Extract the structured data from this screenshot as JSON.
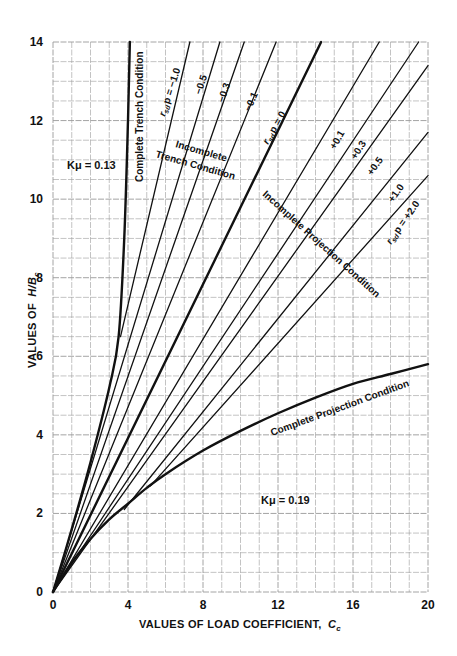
{
  "chart_data": {
    "type": "line",
    "title": "",
    "xlabel": "VALUES OF LOAD COEFFICIENT, Cc",
    "ylabel": "VALUES OF H/Bc",
    "xlim": [
      0,
      20
    ],
    "ylim": [
      0,
      14
    ],
    "x_ticks": [
      "0",
      "4",
      "8",
      "12",
      "16",
      "20"
    ],
    "y_ticks": [
      "0",
      "2",
      "4",
      "6",
      "8",
      "10",
      "12",
      "14"
    ],
    "grid": true,
    "legend": "none (inline labels)",
    "series": [
      {
        "name": "Complete Trench Condition",
        "weight": "heavy",
        "points": [
          [
            0,
            0
          ],
          [
            1,
            1.6
          ],
          [
            2,
            3.3
          ],
          [
            3,
            5.2
          ],
          [
            3.5,
            6.5
          ],
          [
            3.8,
            9
          ],
          [
            4.0,
            12
          ],
          [
            4.1,
            14
          ]
        ]
      },
      {
        "name": "r_sd p = -1.0",
        "weight": "light",
        "points": [
          [
            3.6,
            6.5
          ],
          [
            7.3,
            14
          ]
        ]
      },
      {
        "name": "r_sd p = -0.5",
        "weight": "light",
        "points": [
          [
            0,
            0
          ],
          [
            8.9,
            14
          ]
        ]
      },
      {
        "name": "r_sd p = -0.3",
        "weight": "light",
        "points": [
          [
            0,
            0
          ],
          [
            10.2,
            14
          ]
        ]
      },
      {
        "name": "r_sd p = -0.1",
        "weight": "light",
        "points": [
          [
            0,
            0
          ],
          [
            11.9,
            14
          ]
        ]
      },
      {
        "name": "r_sd p = 0",
        "weight": "heavy",
        "points": [
          [
            0,
            0
          ],
          [
            14.3,
            14
          ]
        ]
      },
      {
        "name": "r_sd p = +0.1",
        "weight": "light",
        "points": [
          [
            0,
            0
          ],
          [
            17.4,
            14
          ]
        ]
      },
      {
        "name": "r_sd p = +0.3",
        "weight": "light",
        "points": [
          [
            0,
            0
          ],
          [
            19.5,
            14
          ]
        ]
      },
      {
        "name": "r_sd p = +0.5",
        "weight": "light",
        "points": [
          [
            0,
            0
          ],
          [
            20,
            13.4
          ]
        ]
      },
      {
        "name": "r_sd p = +1.0",
        "weight": "light",
        "points": [
          [
            3.8,
            2.1
          ],
          [
            20,
            11.7
          ]
        ]
      },
      {
        "name": "r_sd p = +2.0",
        "weight": "light",
        "points": [
          [
            5.2,
            2.7
          ],
          [
            20,
            10.6
          ]
        ]
      },
      {
        "name": "Complete Projection Condition",
        "weight": "heavy",
        "points": [
          [
            0,
            0
          ],
          [
            1,
            0.75
          ],
          [
            2,
            1.35
          ],
          [
            3,
            1.85
          ],
          [
            4,
            2.25
          ],
          [
            5,
            2.65
          ],
          [
            6,
            3.0
          ],
          [
            8,
            3.6
          ],
          [
            10,
            4.1
          ],
          [
            12,
            4.55
          ],
          [
            14,
            4.95
          ],
          [
            16,
            5.3
          ],
          [
            18,
            5.55
          ],
          [
            20,
            5.8
          ]
        ]
      }
    ],
    "annotations": [
      "Kμ = 0.13",
      "Kμ = 0.19",
      "Complete Trench Condition",
      "Incomplete Trench Condition",
      "Incomplete Projection Condition",
      "Complete Projection Condition",
      "r_sd p = −1.0",
      "−0.5",
      "−0.3",
      "−0.1",
      "r_sd p = 0",
      "+0.1",
      "+0.3",
      "+0.5",
      "+1.0",
      "r_sd p = +2.0"
    ]
  },
  "labels": {
    "x_axis_title": "VALUES OF LOAD COEFFICIENT,",
    "x_axis_symbol": "C",
    "x_axis_sub": "c",
    "y_axis_title": "VALUES OF",
    "y_axis_symbol": "H/B",
    "y_axis_sub": "c",
    "k_trench": "Kμ = 0.13",
    "k_projection": "Kμ = 0.19",
    "complete_trench": "Complete Trench Condition",
    "incomplete_trench_1": "Incomplete",
    "incomplete_trench_2": "Trench Condition",
    "incomplete_projection": "Incomplete Projection Condition",
    "complete_projection": "Complete Projection Condition",
    "r_m10": "r",
    "r_m10_sub": "sd",
    "r_m10_p": "p = −1.0",
    "r_m05": "−0.5",
    "r_m03": "−0.3",
    "r_m01": "−0.1",
    "r_0": "r",
    "r_0_sub": "sd",
    "r_0_p": "p = 0",
    "r_p01": "+0.1",
    "r_p03": "+0.3",
    "r_p05": "+0.5",
    "r_p10": "+1.0",
    "r_p20": "r",
    "r_p20_sub": "sd",
    "r_p20_p": "p = +2.0"
  }
}
